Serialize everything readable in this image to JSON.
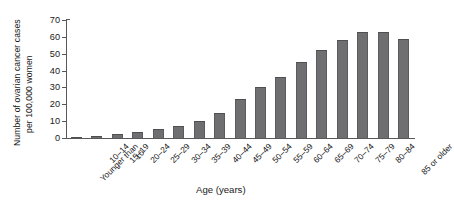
{
  "chart_data": {
    "type": "bar",
    "title": "",
    "xlabel": "Age (years)",
    "ylabel_line1": "Number of ovarian cancer cases",
    "ylabel_line2": "per 100,000 women",
    "ylim": [
      0,
      70
    ],
    "yticks": [
      0,
      10,
      20,
      30,
      40,
      50,
      60,
      70
    ],
    "grid": false,
    "legend": "none",
    "bar_color": "#6f6f71",
    "axis_color": "#58585a",
    "categories": [
      "Younger than 10",
      "10–14",
      "15–19",
      "20–24",
      "25–29",
      "30–34",
      "35–39",
      "40–44",
      "45–49",
      "50–54",
      "55–59",
      "60–64",
      "65–69",
      "70–74",
      "75–79",
      "80–84",
      "85 or older"
    ],
    "values": [
      0.3,
      1,
      2.5,
      3.5,
      5.5,
      7,
      10,
      15,
      23,
      30,
      36,
      45,
      52,
      58,
      63,
      63,
      59
    ]
  }
}
